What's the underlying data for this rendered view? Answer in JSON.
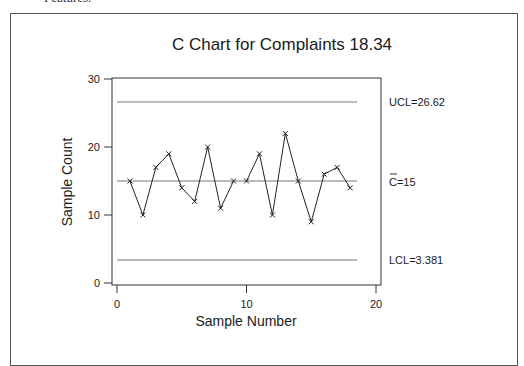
{
  "page": {
    "cut_off_text": "Features."
  },
  "chart_data": {
    "type": "line",
    "title": "C Chart for Complaints 18.34",
    "xlabel": "Sample Number",
    "ylabel": "Sample Count",
    "x_ticks": [
      0,
      10,
      20
    ],
    "y_ticks": [
      0,
      10,
      20,
      30
    ],
    "xlim": [
      0,
      20
    ],
    "ylim": [
      0,
      30
    ],
    "grid": false,
    "legend": null,
    "x": [
      1,
      2,
      3,
      4,
      5,
      6,
      7,
      8,
      9,
      10,
      11,
      12,
      13,
      14,
      15,
      16,
      17,
      18
    ],
    "series": [
      {
        "name": "Complaints",
        "marker": "x",
        "values": [
          15,
          10,
          17,
          19,
          14,
          12,
          20,
          11,
          15,
          15,
          19,
          10,
          22,
          15,
          9,
          16,
          17,
          14
        ],
        "segments": [
          [
            1,
            9
          ],
          [
            10,
            18
          ]
        ]
      }
    ],
    "control_limits": {
      "ucl": 26.62,
      "center": 15,
      "lcl": 3.381
    },
    "annotations": {
      "ucl_label": "UCL=26.62",
      "center_label": "C=15",
      "center_bar": "¯",
      "lcl_label": "LCL=3.381"
    }
  }
}
